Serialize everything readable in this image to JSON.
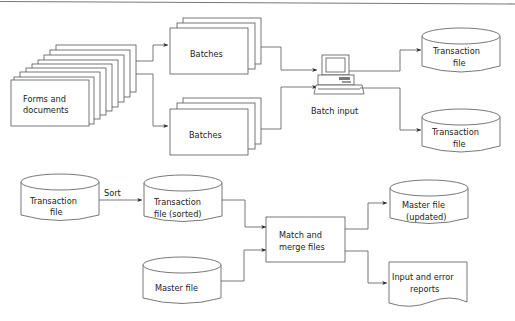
{
  "diagram": {
    "top_section": {
      "forms": {
        "line1": "Forms and",
        "line2": "documents"
      },
      "batches_top": "Batches",
      "batches_bottom": "Batches",
      "batch_input": "Batch input",
      "transaction_file_1": {
        "line1": "Transaction",
        "line2": "file"
      },
      "transaction_file_2": {
        "line1": "Transaction",
        "line2": "file"
      }
    },
    "bottom_section": {
      "transaction_file": {
        "line1": "Transaction",
        "line2": "file"
      },
      "sort_label": "Sort",
      "transaction_sorted": {
        "line1": "Transaction",
        "line2": "file (sorted)"
      },
      "master_file": "Master file",
      "match_merge": {
        "line1": "Match and",
        "line2": "merge files"
      },
      "master_updated": {
        "line1": "Master file",
        "line2": "(updated)"
      },
      "reports": {
        "line1": "Input and error",
        "line2": "reports"
      }
    },
    "colors": {
      "stroke": "#555555",
      "background": "#ffffff",
      "text": "#222222"
    }
  }
}
